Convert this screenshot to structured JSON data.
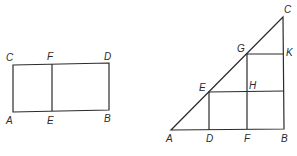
{
  "figure_left": {
    "labels": {
      "C": "C",
      "F": "F",
      "D": "D",
      "A": "A",
      "E": "E",
      "B": "B"
    }
  },
  "figure_right": {
    "labels": {
      "C": "C",
      "G": "G",
      "K": "K",
      "E": "E",
      "H": "H",
      "A": "A",
      "D": "D",
      "F": "F",
      "B": "B"
    }
  },
  "colors": {
    "line": "#2b2b2b",
    "background": "#ffffff"
  }
}
